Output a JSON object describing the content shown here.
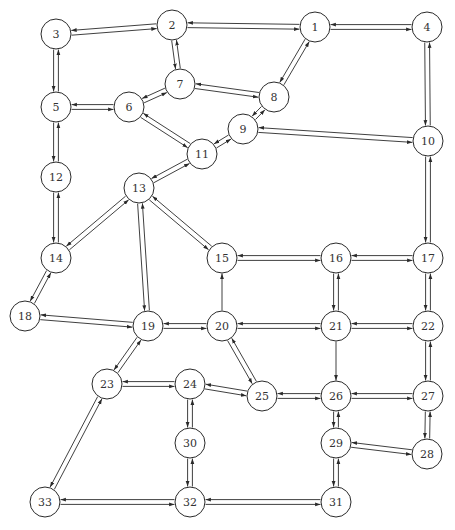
{
  "diagram": {
    "type": "directed-network",
    "node_radius": 15,
    "colors": {
      "stroke": "#2a2a2a",
      "node_fill": "#ffffff",
      "label": "#333333",
      "background": "#ffffff"
    },
    "nodes": [
      {
        "id": "1",
        "label": "1",
        "x": 315,
        "y": 27
      },
      {
        "id": "2",
        "label": "2",
        "x": 172,
        "y": 25
      },
      {
        "id": "3",
        "label": "3",
        "x": 56,
        "y": 34
      },
      {
        "id": "4",
        "label": "4",
        "x": 427,
        "y": 27
      },
      {
        "id": "5",
        "label": "5",
        "x": 56,
        "y": 107
      },
      {
        "id": "6",
        "label": "6",
        "x": 129,
        "y": 107
      },
      {
        "id": "7",
        "label": "7",
        "x": 180,
        "y": 84
      },
      {
        "id": "8",
        "label": "8",
        "x": 274,
        "y": 97
      },
      {
        "id": "9",
        "label": "9",
        "x": 243,
        "y": 129
      },
      {
        "id": "10",
        "label": "10",
        "x": 428,
        "y": 141
      },
      {
        "id": "11",
        "label": "11",
        "x": 202,
        "y": 154
      },
      {
        "id": "12",
        "label": "12",
        "x": 56,
        "y": 177
      },
      {
        "id": "13",
        "label": "13",
        "x": 139,
        "y": 188
      },
      {
        "id": "14",
        "label": "14",
        "x": 56,
        "y": 258
      },
      {
        "id": "15",
        "label": "15",
        "x": 222,
        "y": 258
      },
      {
        "id": "16",
        "label": "16",
        "x": 336,
        "y": 258
      },
      {
        "id": "17",
        "label": "17",
        "x": 428,
        "y": 258
      },
      {
        "id": "18",
        "label": "18",
        "x": 25,
        "y": 316
      },
      {
        "id": "19",
        "label": "19",
        "x": 148,
        "y": 326
      },
      {
        "id": "20",
        "label": "20",
        "x": 222,
        "y": 326
      },
      {
        "id": "21",
        "label": "21",
        "x": 336,
        "y": 326
      },
      {
        "id": "22",
        "label": "22",
        "x": 428,
        "y": 326
      },
      {
        "id": "23",
        "label": "23",
        "x": 107,
        "y": 384
      },
      {
        "id": "24",
        "label": "24",
        "x": 190,
        "y": 384
      },
      {
        "id": "25",
        "label": "25",
        "x": 262,
        "y": 396
      },
      {
        "id": "26",
        "label": "26",
        "x": 336,
        "y": 396
      },
      {
        "id": "27",
        "label": "27",
        "x": 428,
        "y": 396
      },
      {
        "id": "28",
        "label": "28",
        "x": 427,
        "y": 454
      },
      {
        "id": "29",
        "label": "29",
        "x": 336,
        "y": 443
      },
      {
        "id": "30",
        "label": "30",
        "x": 190,
        "y": 443
      },
      {
        "id": "31",
        "label": "31",
        "x": 336,
        "y": 502
      },
      {
        "id": "32",
        "label": "32",
        "x": 190,
        "y": 502
      },
      {
        "id": "33",
        "label": "33",
        "x": 45,
        "y": 502
      }
    ],
    "edges": [
      {
        "from": "2",
        "to": "1",
        "bidirectional": true
      },
      {
        "from": "1",
        "to": "4",
        "bidirectional": true
      },
      {
        "from": "3",
        "to": "2",
        "bidirectional": true
      },
      {
        "from": "3",
        "to": "5",
        "bidirectional": true
      },
      {
        "from": "2",
        "to": "7",
        "bidirectional": true
      },
      {
        "from": "1",
        "to": "8",
        "bidirectional": true
      },
      {
        "from": "4",
        "to": "10",
        "bidirectional": true
      },
      {
        "from": "5",
        "to": "6",
        "bidirectional": true
      },
      {
        "from": "6",
        "to": "7",
        "bidirectional": true
      },
      {
        "from": "7",
        "to": "8",
        "bidirectional": true
      },
      {
        "from": "8",
        "to": "9",
        "bidirectional": true
      },
      {
        "from": "6",
        "to": "11",
        "bidirectional": true
      },
      {
        "from": "9",
        "to": "11",
        "bidirectional": true
      },
      {
        "from": "9",
        "to": "10",
        "bidirectional": true
      },
      {
        "from": "5",
        "to": "12",
        "bidirectional": true
      },
      {
        "from": "11",
        "to": "13",
        "bidirectional": true
      },
      {
        "from": "10",
        "to": "17",
        "bidirectional": true
      },
      {
        "from": "12",
        "to": "14",
        "bidirectional": true
      },
      {
        "from": "13",
        "to": "14",
        "bidirectional": true
      },
      {
        "from": "13",
        "to": "15",
        "bidirectional": true
      },
      {
        "from": "13",
        "to": "19",
        "bidirectional": true
      },
      {
        "from": "14",
        "to": "18",
        "bidirectional": true
      },
      {
        "from": "15",
        "to": "16",
        "bidirectional": true
      },
      {
        "from": "16",
        "to": "17",
        "bidirectional": true
      },
      {
        "from": "16",
        "to": "21",
        "bidirectional": true
      },
      {
        "from": "17",
        "to": "22",
        "bidirectional": true
      },
      {
        "from": "20",
        "to": "15",
        "bidirectional": false
      },
      {
        "from": "18",
        "to": "19",
        "bidirectional": true
      },
      {
        "from": "19",
        "to": "20",
        "bidirectional": true
      },
      {
        "from": "20",
        "to": "21",
        "bidirectional": true
      },
      {
        "from": "21",
        "to": "22",
        "bidirectional": true
      },
      {
        "from": "19",
        "to": "23",
        "bidirectional": true
      },
      {
        "from": "20",
        "to": "25",
        "bidirectional": true
      },
      {
        "from": "21",
        "to": "26",
        "bidirectional": false
      },
      {
        "from": "22",
        "to": "27",
        "bidirectional": true
      },
      {
        "from": "23",
        "to": "24",
        "bidirectional": true
      },
      {
        "from": "24",
        "to": "25",
        "bidirectional": true
      },
      {
        "from": "25",
        "to": "26",
        "bidirectional": true
      },
      {
        "from": "26",
        "to": "27",
        "bidirectional": true
      },
      {
        "from": "27",
        "to": "28",
        "bidirectional": true
      },
      {
        "from": "26",
        "to": "29",
        "bidirectional": true
      },
      {
        "from": "29",
        "to": "28",
        "bidirectional": true
      },
      {
        "from": "24",
        "to": "30",
        "bidirectional": true
      },
      {
        "from": "29",
        "to": "31",
        "bidirectional": true
      },
      {
        "from": "30",
        "to": "32",
        "bidirectional": true
      },
      {
        "from": "23",
        "to": "33",
        "bidirectional": true
      },
      {
        "from": "33",
        "to": "32",
        "bidirectional": true
      },
      {
        "from": "32",
        "to": "31",
        "bidirectional": true
      }
    ]
  }
}
